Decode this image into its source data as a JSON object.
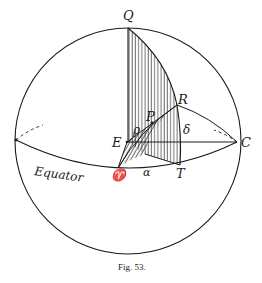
{
  "figure": {
    "caption": "Fig. 53.",
    "colors": {
      "ink": "#1a1a1a",
      "background": "#ffffff"
    }
  },
  "labels": {
    "Q": "Q",
    "R": "R",
    "P": "P",
    "E": "E",
    "C": "C",
    "T": "T",
    "aries": "♈",
    "rho": "ρ",
    "delta": "δ",
    "alpha": "α",
    "equator": "Equator"
  },
  "points": {
    "Q": [
      128,
      28
    ],
    "R": [
      177,
      105
    ],
    "E": [
      127,
      142
    ],
    "C": [
      237,
      142
    ],
    "T": [
      180,
      165
    ],
    "aries": [
      118,
      168
    ],
    "P": [
      152,
      123
    ],
    "left_equator": [
      16,
      140
    ]
  }
}
